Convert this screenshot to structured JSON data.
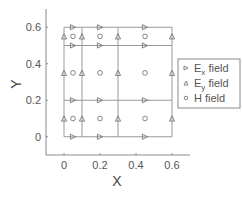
{
  "chart_data": {
    "type": "scatter",
    "title": "",
    "xlabel": "X",
    "ylabel": "Y",
    "xlim": [
      -0.1,
      0.7
    ],
    "ylim": [
      -0.1,
      0.7
    ],
    "xticks": [
      0,
      0.2,
      0.4,
      0.6
    ],
    "xtick_labels": [
      "0",
      "0.2",
      "0.4",
      "0.6"
    ],
    "yticks": [
      0,
      0.2,
      0.4,
      0.6
    ],
    "ytick_labels": [
      "0",
      "0.2",
      "0.4",
      "0.6"
    ],
    "grid": false,
    "grid_lines": {
      "vertical_x": [
        0,
        0.1,
        0.3,
        0.6
      ],
      "horizontal_y": [
        0,
        0.2,
        0.5,
        0.6
      ],
      "x_extent": [
        0,
        0.6
      ],
      "y_extent": [
        0,
        0.6
      ]
    },
    "legend_position": "right",
    "series": [
      {
        "name": "E_x field",
        "label_main": "E",
        "label_sub": "x",
        "label_rest": " field",
        "marker": "triangle-right",
        "points": [
          [
            0.05,
            0
          ],
          [
            0.2,
            0
          ],
          [
            0.45,
            0
          ],
          [
            0.05,
            0.2
          ],
          [
            0.2,
            0.2
          ],
          [
            0.45,
            0.2
          ],
          [
            0.05,
            0.5
          ],
          [
            0.2,
            0.5
          ],
          [
            0.45,
            0.5
          ],
          [
            0.05,
            0.6
          ],
          [
            0.2,
            0.6
          ],
          [
            0.45,
            0.6
          ]
        ]
      },
      {
        "name": "E_y field",
        "label_main": "E",
        "label_sub": "y",
        "label_rest": " field",
        "marker": "triangle-up",
        "points": [
          [
            0,
            0.1
          ],
          [
            0.1,
            0.1
          ],
          [
            0.3,
            0.1
          ],
          [
            0.6,
            0.1
          ],
          [
            0,
            0.35
          ],
          [
            0.1,
            0.35
          ],
          [
            0.3,
            0.35
          ],
          [
            0.6,
            0.35
          ],
          [
            0,
            0.55
          ],
          [
            0.1,
            0.55
          ],
          [
            0.3,
            0.55
          ],
          [
            0.6,
            0.55
          ]
        ]
      },
      {
        "name": "H field",
        "label_main": "H field",
        "label_sub": "",
        "label_rest": "",
        "marker": "circle",
        "points": [
          [
            0.05,
            0.1
          ],
          [
            0.2,
            0.1
          ],
          [
            0.45,
            0.1
          ],
          [
            0.05,
            0.35
          ],
          [
            0.2,
            0.35
          ],
          [
            0.45,
            0.35
          ],
          [
            0.05,
            0.55
          ],
          [
            0.2,
            0.55
          ],
          [
            0.45,
            0.55
          ]
        ]
      }
    ]
  },
  "colors": {
    "axis": "#8a8a8a",
    "grid_line": "#999999",
    "marker": "#777777",
    "text": "#555555"
  }
}
